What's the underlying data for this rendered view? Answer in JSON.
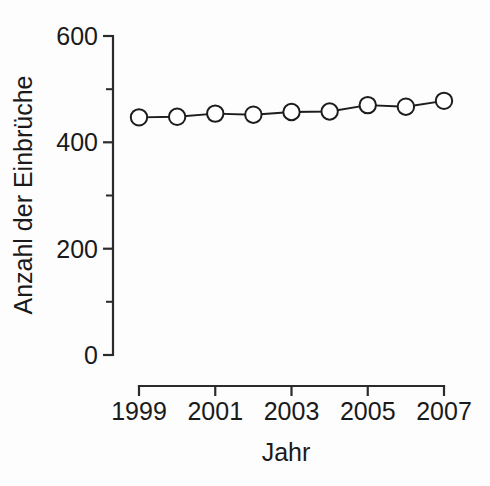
{
  "chart_data": {
    "type": "line",
    "title": "",
    "subtitle": "",
    "xlabel": "Jahr",
    "ylabel": "Anzahl der Einbrüche",
    "x": [
      1999,
      2000,
      2001,
      2002,
      2003,
      2004,
      2005,
      2006,
      2007
    ],
    "values": [
      447,
      448,
      454,
      452,
      457,
      458,
      470,
      467,
      478
    ],
    "series": [
      {
        "name": "Anzahl der Einbrüche",
        "values": [
          447,
          448,
          454,
          452,
          457,
          458,
          470,
          467,
          478
        ],
        "marker": "open-circle",
        "color": "#1c1c1c"
      }
    ],
    "xlim": [
      1999,
      2007
    ],
    "ylim": [
      0,
      600
    ],
    "ytick_labels": [
      "0",
      "200",
      "400",
      "600"
    ],
    "ytick_values": [
      0,
      200,
      400,
      600
    ],
    "yminor_values": [
      100,
      300,
      500
    ],
    "xtick_labels": [
      "1999",
      "2001",
      "2003",
      "2005",
      "2007"
    ],
    "xtick_values": [
      1999,
      2001,
      2003,
      2005,
      2007
    ],
    "xminor_values": [
      2000,
      2002,
      2004,
      2006
    ],
    "grid": false,
    "legend": false,
    "legend_position": "none",
    "annotations": []
  },
  "axes": {
    "y_axis_title": "Anzahl der Einbrüche",
    "x_axis_title": "Jahr",
    "y_labels": [
      "600",
      "400",
      "200",
      "0"
    ],
    "x_labels": [
      "1999",
      "2001",
      "2003",
      "2005",
      "2007"
    ]
  },
  "colors": {
    "background": "#fdfdfd",
    "axis": "#2b2b2b",
    "series": "#1c1c1c",
    "marker_fill": "#ffffff",
    "text": "#1a1a1a"
  }
}
